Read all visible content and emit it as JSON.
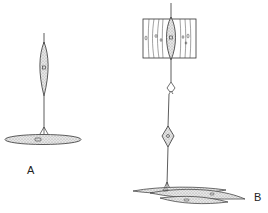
{
  "figure": {
    "panels": [
      {
        "id": "A",
        "label": "A",
        "description": "Spindle-shaped cell with a long process ending on a flattened elongated cell"
      },
      {
        "id": "B",
        "label": "B",
        "description": "Chain: spindle cell inside a striated block, a junction, a diamond-shaped cell, and a process ending on layered elongated cells"
      }
    ],
    "colors": {
      "ink": "#333333",
      "stipple": "#bbbbbb",
      "background": "#ffffff"
    }
  }
}
